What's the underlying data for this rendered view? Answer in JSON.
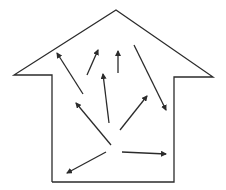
{
  "diagram": {
    "type": "house-with-arrows",
    "colors": {
      "stroke": "#2b2b2b",
      "background": "#ffffff"
    },
    "house_outline": [
      [
        52,
        182
      ],
      [
        52,
        75
      ],
      [
        14,
        75
      ],
      [
        116,
        10
      ],
      [
        213,
        77
      ],
      [
        174,
        77
      ],
      [
        174,
        182
      ],
      [
        52,
        182
      ]
    ],
    "arrows": [
      {
        "from": [
          83,
          94
        ],
        "to": [
          57,
          53
        ]
      },
      {
        "from": [
          87,
          75
        ],
        "to": [
          98,
          50
        ]
      },
      {
        "from": [
          118,
          73
        ],
        "to": [
          118,
          51
        ]
      },
      {
        "from": [
          134,
          45
        ],
        "to": [
          166,
          110
        ]
      },
      {
        "from": [
          109,
          123
        ],
        "to": [
          103,
          74
        ]
      },
      {
        "from": [
          120,
          130
        ],
        "to": [
          147,
          96
        ]
      },
      {
        "from": [
          111,
          145
        ],
        "to": [
          76,
          103
        ]
      },
      {
        "from": [
          106,
          152
        ],
        "to": [
          67,
          173
        ]
      },
      {
        "from": [
          122,
          152
        ],
        "to": [
          166,
          154
        ]
      }
    ]
  }
}
